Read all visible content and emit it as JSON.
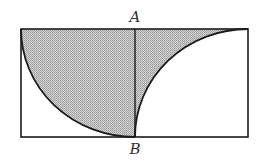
{
  "diagram": {
    "labels": {
      "top": "A",
      "bottom": "B"
    },
    "colors": {
      "stroke": "#1a1a1a",
      "shade": "#b8b8b8",
      "background": "#ffffff"
    },
    "rectangle": {
      "x": 21,
      "y": 29,
      "width": 227,
      "height": 108
    },
    "midline_x": 135
  }
}
